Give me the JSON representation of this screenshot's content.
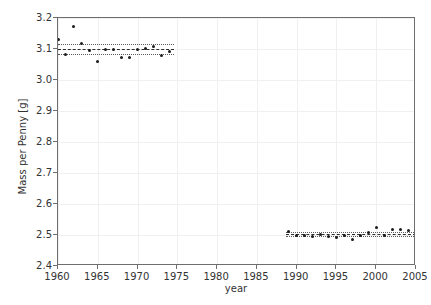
{
  "chart_data": {
    "type": "scatter",
    "title": "",
    "xlabel": "year",
    "ylabel": "Mass per Penny [g]",
    "xlim": [
      1960,
      2005
    ],
    "ylim": [
      2.4,
      3.2
    ],
    "xticks": [
      1960,
      1965,
      1970,
      1975,
      1980,
      1985,
      1990,
      1995,
      2000,
      2005
    ],
    "xtick_labels": [
      "1960",
      "1965",
      "1970",
      "1975",
      "1980",
      "1985",
      "1990",
      "1995",
      "2000",
      "2005"
    ],
    "yticks": [
      2.4,
      2.5,
      2.6,
      2.7,
      2.8,
      2.9,
      3.0,
      3.1,
      3.2
    ],
    "ytick_labels": [
      "2.4",
      "2.5",
      "2.6",
      "2.7",
      "2.8",
      "2.9",
      "3.0",
      "3.1",
      "3.2"
    ],
    "grid": true,
    "legend": "none",
    "marker_color": "#1a1a1a",
    "series": [
      {
        "name": "copper pennies",
        "x": [
          1960,
          1961,
          1962,
          1963,
          1964,
          1965,
          1966,
          1967,
          1968,
          1969,
          1970,
          1971,
          1972,
          1973,
          1974
        ],
        "y": [
          3.131,
          3.082,
          3.173,
          3.118,
          3.096,
          3.059,
          3.098,
          3.097,
          3.073,
          3.074,
          3.099,
          3.103,
          3.108,
          3.079,
          3.093
        ]
      },
      {
        "name": "zinc pennies",
        "x": [
          1989,
          1990,
          1991,
          1992,
          1993,
          1994,
          1995,
          1996,
          1997,
          1998,
          1999,
          2000,
          2001,
          2002,
          2003,
          2004
        ],
        "y": [
          2.512,
          2.498,
          2.497,
          2.496,
          2.502,
          2.495,
          2.492,
          2.498,
          2.486,
          2.497,
          2.509,
          2.523,
          2.5,
          2.517,
          2.519,
          2.513
        ]
      }
    ],
    "reference_lines": [
      {
        "name": "copper-mean",
        "style": "dashed",
        "y": 3.0995,
        "x_start": 1960,
        "x_end": 1974.6
      },
      {
        "name": "copper-upper-band",
        "style": "dotted",
        "y": 3.1155,
        "x_start": 1960,
        "x_end": 1974.6
      },
      {
        "name": "copper-lower-band",
        "style": "dotted",
        "y": 3.0835,
        "x_start": 1960,
        "x_end": 1974.6
      },
      {
        "name": "zinc-mean",
        "style": "dashed",
        "y": 2.5035,
        "x_start": 1988.6,
        "x_end": 2005
      },
      {
        "name": "zinc-upper-band",
        "style": "dotted",
        "y": 2.5095,
        "x_start": 1988.6,
        "x_end": 2005
      },
      {
        "name": "zinc-lower-band",
        "style": "dotted",
        "y": 2.4975,
        "x_start": 1988.6,
        "x_end": 2005
      }
    ]
  },
  "axes": {
    "xlabel": "year",
    "ylabel": "Mass per Penny [g]"
  }
}
